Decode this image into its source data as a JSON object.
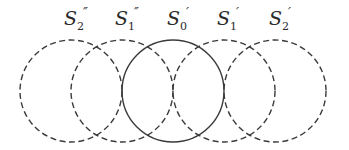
{
  "diagram": {
    "stroke_color": "#3a3a3a",
    "circles": [
      {
        "id": "S2pp",
        "label_main": "S",
        "subscript": "2",
        "prime": "″",
        "style": "dashed",
        "cx": 71,
        "cy": 91,
        "r": 51
      },
      {
        "id": "S1pp",
        "label_main": "S",
        "subscript": "1",
        "prime": "″",
        "style": "dashed",
        "cx": 122,
        "cy": 91,
        "r": 51
      },
      {
        "id": "S0p",
        "label_main": "S",
        "subscript": "0",
        "prime": "′",
        "style": "solid",
        "cx": 173,
        "cy": 91,
        "r": 51
      },
      {
        "id": "S1p",
        "label_main": "S",
        "subscript": "1",
        "prime": "′",
        "style": "dashed",
        "cx": 224,
        "cy": 91,
        "r": 51
      },
      {
        "id": "S2p",
        "label_main": "S",
        "subscript": "2",
        "prime": "′",
        "style": "dashed",
        "cx": 275,
        "cy": 91,
        "r": 51
      }
    ]
  }
}
